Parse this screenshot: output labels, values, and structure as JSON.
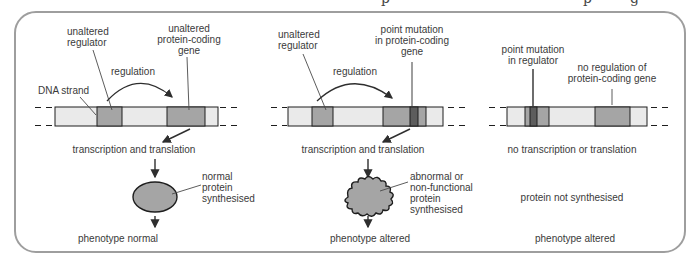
{
  "page": {
    "cropped_caption_fragments": [
      "p",
      "p",
      "g"
    ]
  },
  "colors": {
    "box_border": "#9e9e9e",
    "text": "#3a3a3a",
    "strand_light": "#eaeaea",
    "segment_gray": "#a5a5a5",
    "mutation_dark": "#5d5d5d",
    "line": "#2e2e2e",
    "leader_gray": "#9e9e9e"
  },
  "panels": [
    {
      "id": "unaltered-genes",
      "labels": {
        "dna_strand": "DNA strand",
        "regulator": "unaltered\nregulator",
        "gene": "unaltered\nprotein-coding\ngene",
        "regulation": "regulation",
        "process": "transcription and translation",
        "protein": "normal\nprotein\nsynthesised",
        "phenotype": "phenotype normal"
      }
    },
    {
      "id": "point-mutation-in-gene",
      "labels": {
        "regulator": "unaltered\nregulator",
        "gene": "point mutation\nin protein-coding\ngene",
        "regulation": "regulation",
        "process": "transcription and translation",
        "protein": "abnormal or\nnon-functional\nprotein\nsynthesised",
        "phenotype": "phenotype altered"
      }
    },
    {
      "id": "point-mutation-in-regulator",
      "labels": {
        "regulator": "point mutation\nin regulator",
        "gene": "no regulation of\nprotein-coding gene",
        "process": "no transcription or translation",
        "protein": "protein not synthesised",
        "phenotype": "phenotype altered"
      }
    }
  ]
}
